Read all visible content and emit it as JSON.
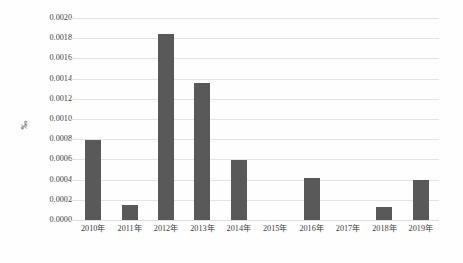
{
  "chart_data": {
    "type": "bar",
    "title": "",
    "xlabel": "",
    "ylabel": "‰",
    "categories": [
      "2010年",
      "2011年",
      "2012年",
      "2013年",
      "2014年",
      "2015年",
      "2016年",
      "2017年",
      "2018年",
      "2019年"
    ],
    "values": [
      0.00079,
      0.00015,
      0.00184,
      0.00136,
      0.00059,
      0.0,
      0.00042,
      0.0,
      0.00013,
      0.0004
    ],
    "ylim": [
      0.0,
      0.002
    ],
    "ytick_labels": [
      "0.0020",
      "0.0018",
      "0.0016",
      "0.0014",
      "0.0012",
      "0.0010",
      "0.0008",
      "0.0006",
      "0.0004",
      "0.0002",
      "0.0000"
    ],
    "ytick_values": [
      0.002,
      0.0018,
      0.0016,
      0.0014,
      0.0012,
      0.001,
      0.0008,
      0.0006,
      0.0004,
      0.0002,
      0.0
    ],
    "grid": true,
    "legend": "none",
    "series_color": "#595959",
    "gridline_color": "#e4e4e4",
    "background_color": "#fefefe"
  }
}
